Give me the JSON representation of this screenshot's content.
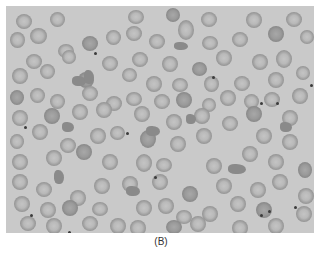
{
  "figure": {
    "caption": "(B)",
    "colors": {
      "background": "#c9c9c9",
      "cell_rim": "#8c8c8c",
      "cell_center": "#c4c4c4",
      "platelet": "#3c3c3c"
    },
    "cells": [
      [
        10,
        8,
        16,
        15
      ],
      [
        44,
        6,
        15,
        15
      ],
      [
        122,
        4,
        16,
        14
      ],
      [
        160,
        2,
        14,
        14
      ],
      [
        195,
        6,
        16,
        15
      ],
      [
        240,
        6,
        16,
        16
      ],
      [
        280,
        6,
        16,
        15
      ],
      [
        4,
        26,
        15,
        16
      ],
      [
        24,
        22,
        17,
        16
      ],
      [
        52,
        38,
        16,
        14
      ],
      [
        76,
        30,
        16,
        15
      ],
      [
        100,
        24,
        15,
        15
      ],
      [
        120,
        20,
        16,
        15
      ],
      [
        143,
        28,
        16,
        15
      ],
      [
        172,
        14,
        16,
        20
      ],
      [
        196,
        30,
        16,
        14
      ],
      [
        226,
        26,
        16,
        15
      ],
      [
        262,
        20,
        16,
        16
      ],
      [
        294,
        24,
        14,
        14
      ],
      [
        20,
        48,
        16,
        15
      ],
      [
        56,
        44,
        14,
        14
      ],
      [
        96,
        50,
        16,
        15
      ],
      [
        126,
        46,
        16,
        15
      ],
      [
        156,
        50,
        16,
        16
      ],
      [
        186,
        56,
        15,
        14
      ],
      [
        210,
        44,
        16,
        16
      ],
      [
        246,
        48,
        16,
        16
      ],
      [
        270,
        44,
        16,
        18
      ],
      [
        290,
        60,
        14,
        14
      ],
      [
        6,
        62,
        16,
        16
      ],
      [
        34,
        58,
        15,
        15
      ],
      [
        72,
        66,
        16,
        16
      ],
      [
        116,
        62,
        15,
        14
      ],
      [
        140,
        70,
        16,
        16
      ],
      [
        166,
        72,
        16,
        14
      ],
      [
        198,
        70,
        15,
        16
      ],
      [
        228,
        70,
        16,
        15
      ],
      [
        262,
        66,
        16,
        16
      ],
      [
        4,
        84,
        14,
        15
      ],
      [
        24,
        82,
        15,
        15
      ],
      [
        44,
        88,
        15,
        15
      ],
      [
        76,
        80,
        16,
        15
      ],
      [
        100,
        90,
        16,
        15
      ],
      [
        120,
        86,
        16,
        14
      ],
      [
        148,
        88,
        16,
        15
      ],
      [
        170,
        86,
        16,
        16
      ],
      [
        196,
        92,
        14,
        14
      ],
      [
        214,
        84,
        16,
        16
      ],
      [
        238,
        88,
        15,
        15
      ],
      [
        258,
        86,
        16,
        15
      ],
      [
        286,
        82,
        16,
        16
      ],
      [
        6,
        104,
        16,
        16
      ],
      [
        38,
        102,
        16,
        16
      ],
      [
        66,
        98,
        16,
        16
      ],
      [
        90,
        96,
        16,
        16
      ],
      [
        128,
        100,
        16,
        16
      ],
      [
        160,
        108,
        16,
        16
      ],
      [
        188,
        102,
        16,
        16
      ],
      [
        216,
        110,
        16,
        15
      ],
      [
        240,
        100,
        16,
        16
      ],
      [
        276,
        104,
        16,
        16
      ],
      [
        4,
        128,
        14,
        15
      ],
      [
        26,
        118,
        16,
        16
      ],
      [
        54,
        132,
        16,
        15
      ],
      [
        84,
        122,
        16,
        16
      ],
      [
        104,
        120,
        15,
        14
      ],
      [
        134,
        124,
        16,
        18
      ],
      [
        164,
        130,
        16,
        16
      ],
      [
        190,
        122,
        16,
        16
      ],
      [
        250,
        122,
        16,
        16
      ],
      [
        276,
        128,
        16,
        16
      ],
      [
        6,
        148,
        16,
        16
      ],
      [
        40,
        144,
        16,
        16
      ],
      [
        70,
        138,
        16,
        16
      ],
      [
        96,
        148,
        16,
        16
      ],
      [
        130,
        148,
        16,
        18
      ],
      [
        150,
        152,
        16,
        14
      ],
      [
        200,
        152,
        16,
        16
      ],
      [
        236,
        140,
        16,
        16
      ],
      [
        262,
        148,
        16,
        16
      ],
      [
        292,
        156,
        14,
        16
      ],
      [
        6,
        168,
        16,
        16
      ],
      [
        30,
        176,
        16,
        15
      ],
      [
        64,
        184,
        16,
        16
      ],
      [
        88,
        172,
        16,
        16
      ],
      [
        116,
        170,
        16,
        16
      ],
      [
        146,
        168,
        16,
        16
      ],
      [
        176,
        180,
        16,
        16
      ],
      [
        210,
        172,
        16,
        16
      ],
      [
        244,
        176,
        16,
        16
      ],
      [
        266,
        168,
        16,
        16
      ],
      [
        292,
        182,
        16,
        16
      ],
      [
        8,
        190,
        16,
        16
      ],
      [
        34,
        196,
        16,
        16
      ],
      [
        56,
        194,
        16,
        16
      ],
      [
        86,
        196,
        16,
        14
      ],
      [
        130,
        194,
        16,
        16
      ],
      [
        152,
        192,
        16,
        16
      ],
      [
        170,
        204,
        16,
        14
      ],
      [
        196,
        200,
        16,
        16
      ],
      [
        224,
        190,
        16,
        16
      ],
      [
        250,
        196,
        16,
        16
      ],
      [
        290,
        200,
        16,
        16
      ],
      [
        14,
        210,
        16,
        15
      ],
      [
        40,
        212,
        16,
        16
      ],
      [
        76,
        210,
        16,
        15
      ],
      [
        104,
        212,
        16,
        16
      ],
      [
        124,
        214,
        16,
        16
      ],
      [
        160,
        214,
        16,
        14
      ],
      [
        184,
        210,
        16,
        16
      ],
      [
        226,
        214,
        16,
        16
      ],
      [
        262,
        212,
        16,
        16
      ]
    ],
    "fragments": [
      [
        66,
        70,
        14,
        10
      ],
      [
        78,
        64,
        10,
        14
      ],
      [
        56,
        116,
        12,
        10
      ],
      [
        48,
        164,
        10,
        14
      ],
      [
        140,
        120,
        14,
        10
      ],
      [
        222,
        158,
        18,
        10
      ],
      [
        274,
        116,
        12,
        10
      ],
      [
        120,
        180,
        14,
        10
      ],
      [
        180,
        108,
        10,
        10
      ],
      [
        168,
        36,
        14,
        8
      ]
    ],
    "platelets": [
      [
        88,
        46
      ],
      [
        120,
        126
      ],
      [
        206,
        70
      ],
      [
        270,
        96
      ],
      [
        254,
        96
      ],
      [
        148,
        170
      ],
      [
        24,
        208
      ],
      [
        62,
        225
      ],
      [
        254,
        208
      ],
      [
        262,
        204
      ],
      [
        288,
        200
      ],
      [
        304,
        78
      ],
      [
        18,
        120
      ]
    ]
  }
}
